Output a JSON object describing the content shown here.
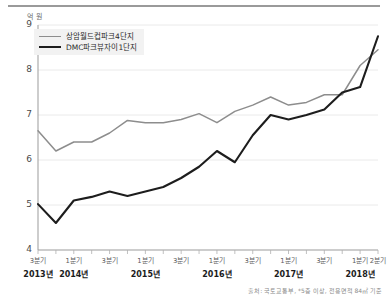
{
  "unit_label": "억 원",
  "source_note": "출처: 국토교통부, *5층 이상, 전용면적 84㎡ 기준",
  "legend": {
    "position": "top-left",
    "items": [
      {
        "label": "상암월드컵파크4단지",
        "color": "#8d8d8d"
      },
      {
        "label": "DMC파크뷰자이1단지",
        "color": "#1d1d1d"
      }
    ]
  },
  "axis": {
    "y_ticks": [
      "9",
      "8",
      "7",
      "6",
      "5",
      "4"
    ],
    "quarter_labels": [
      "3분기",
      "",
      "1분기",
      "",
      "3분기",
      "",
      "1분기",
      "",
      "3분기",
      "",
      "1분기",
      "",
      "3분기",
      "",
      "1분기",
      "",
      "3분기",
      "",
      "1분기",
      "2분기"
    ],
    "year_labels": [
      {
        "text": "2013년",
        "index": 0
      },
      {
        "text": "2014년",
        "index": 2
      },
      {
        "text": "2015년",
        "index": 6
      },
      {
        "text": "2016년",
        "index": 10
      },
      {
        "text": "2017년",
        "index": 14
      },
      {
        "text": "2018년",
        "index": 18
      }
    ]
  },
  "chart_data": {
    "type": "line",
    "title": "",
    "xlabel": "",
    "ylabel": "억 원",
    "ylim": [
      4,
      9
    ],
    "yticks": [
      4,
      5,
      6,
      7,
      8,
      9
    ],
    "grid": true,
    "legend_position": "top-left",
    "categories": [
      "2013 3분기",
      "2013 4분기",
      "2014 1분기",
      "2014 2분기",
      "2014 3분기",
      "2014 4분기",
      "2015 1분기",
      "2015 2분기",
      "2015 3분기",
      "2015 4분기",
      "2016 1분기",
      "2016 2분기",
      "2016 3분기",
      "2016 4분기",
      "2017 1분기",
      "2017 2분기",
      "2017 3분기",
      "2017 4분기",
      "2018 1분기",
      "2018 2분기"
    ],
    "series": [
      {
        "name": "상암월드컵파크4단지",
        "color": "#8d8d8d",
        "values": [
          6.65,
          6.2,
          6.4,
          6.4,
          6.6,
          6.88,
          6.83,
          6.83,
          6.9,
          7.03,
          6.83,
          7.08,
          7.22,
          7.4,
          7.22,
          7.28,
          7.45,
          7.45,
          8.1,
          8.45
        ]
      },
      {
        "name": "DMC파크뷰자이1단지",
        "color": "#1d1d1d",
        "values": [
          5.02,
          4.6,
          5.1,
          5.18,
          5.3,
          5.2,
          5.3,
          5.4,
          5.6,
          5.85,
          6.2,
          5.95,
          6.55,
          7.0,
          6.9,
          7.0,
          7.12,
          7.5,
          7.62,
          8.75
        ]
      }
    ]
  }
}
